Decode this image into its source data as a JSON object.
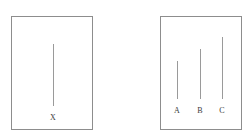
{
  "figure": {
    "background_color": "#ffffff",
    "border_color": "#8d8d8d",
    "line_color": "#9a9a9a",
    "label_color": "#3a3a3a"
  },
  "panels": [
    {
      "id": "left",
      "name": "single-segment-panel",
      "segments": [
        {
          "label": "X",
          "x": 41,
          "top": 27,
          "bottom": 89,
          "height": 62
        }
      ],
      "label_baseline_y": 97
    },
    {
      "id": "right",
      "name": "three-segment-panel",
      "segments": [
        {
          "label": "A",
          "x": 16,
          "top": 44,
          "bottom": 82,
          "height": 38
        },
        {
          "label": "B",
          "x": 39,
          "top": 32,
          "bottom": 82,
          "height": 50
        },
        {
          "label": "C",
          "x": 61,
          "top": 20,
          "bottom": 82,
          "height": 62
        }
      ],
      "label_baseline_y": 90
    }
  ]
}
